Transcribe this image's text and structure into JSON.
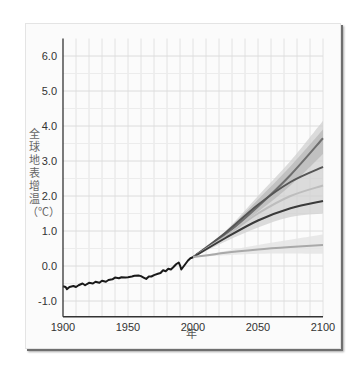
{
  "chart_data": {
    "type": "line",
    "title": "",
    "xlabel": "年",
    "ylabel": "全球地表增温（℃）",
    "xlim": [
      1900,
      2100
    ],
    "ylim": [
      -1.45,
      6.5
    ],
    "grid": true,
    "x_ticks": [
      "1900",
      "1950",
      "2000",
      "2050",
      "2100"
    ],
    "y_ticks": [
      "6.0",
      "5.0",
      "4.0",
      "3.0",
      "2.0",
      "1.0",
      "0.0",
      "-1.0"
    ],
    "x_tick_values": [
      1900,
      1950,
      2000,
      2050,
      2100
    ],
    "y_tick_values": [
      6,
      5,
      4,
      3,
      2,
      1,
      0,
      -1
    ],
    "historical": {
      "name": "observed",
      "color": "#1a1a1a",
      "points": [
        [
          1900,
          -0.58
        ],
        [
          1902,
          -0.6
        ],
        [
          1903,
          -0.66
        ],
        [
          1905,
          -0.6
        ],
        [
          1908,
          -0.57
        ],
        [
          1910,
          -0.6
        ],
        [
          1912,
          -0.55
        ],
        [
          1915,
          -0.5
        ],
        [
          1917,
          -0.55
        ],
        [
          1920,
          -0.48
        ],
        [
          1923,
          -0.5
        ],
        [
          1925,
          -0.45
        ],
        [
          1928,
          -0.48
        ],
        [
          1930,
          -0.42
        ],
        [
          1933,
          -0.45
        ],
        [
          1935,
          -0.4
        ],
        [
          1938,
          -0.38
        ],
        [
          1940,
          -0.33
        ],
        [
          1943,
          -0.35
        ],
        [
          1945,
          -0.32
        ],
        [
          1948,
          -0.33
        ],
        [
          1950,
          -0.32
        ],
        [
          1953,
          -0.3
        ],
        [
          1955,
          -0.28
        ],
        [
          1958,
          -0.27
        ],
        [
          1960,
          -0.29
        ],
        [
          1962,
          -0.33
        ],
        [
          1964,
          -0.37
        ],
        [
          1966,
          -0.3
        ],
        [
          1968,
          -0.3
        ],
        [
          1970,
          -0.26
        ],
        [
          1973,
          -0.22
        ],
        [
          1975,
          -0.2
        ],
        [
          1977,
          -0.12
        ],
        [
          1979,
          -0.15
        ],
        [
          1981,
          -0.08
        ],
        [
          1983,
          -0.1
        ],
        [
          1985,
          -0.03
        ],
        [
          1987,
          0.05
        ],
        [
          1989,
          0.1
        ],
        [
          1990,
          0.02
        ],
        [
          1991,
          -0.1
        ],
        [
          1992,
          -0.05
        ],
        [
          1994,
          0.05
        ],
        [
          1996,
          0.15
        ],
        [
          1998,
          0.22
        ],
        [
          2000,
          0.25
        ]
      ]
    },
    "series": [
      {
        "name": "scenario-high",
        "color": "#6e6e6e",
        "points": [
          [
            2000,
            0.25
          ],
          [
            2025,
            0.9
          ],
          [
            2050,
            1.7
          ],
          [
            2075,
            2.6
          ],
          [
            2100,
            3.65
          ]
        ]
      },
      {
        "name": "scenario-mid-high",
        "color": "#555555",
        "points": [
          [
            2000,
            0.25
          ],
          [
            2025,
            0.95
          ],
          [
            2050,
            1.75
          ],
          [
            2075,
            2.4
          ],
          [
            2100,
            2.83
          ]
        ]
      },
      {
        "name": "scenario-mid",
        "color": "#bdbdbd",
        "points": [
          [
            2000,
            0.25
          ],
          [
            2025,
            0.85
          ],
          [
            2050,
            1.5
          ],
          [
            2075,
            2.0
          ],
          [
            2100,
            2.3
          ]
        ]
      },
      {
        "name": "scenario-low",
        "color": "#3a3a3a",
        "points": [
          [
            2000,
            0.25
          ],
          [
            2025,
            0.8
          ],
          [
            2050,
            1.3
          ],
          [
            2075,
            1.65
          ],
          [
            2100,
            1.86
          ]
        ]
      },
      {
        "name": "constant-composition",
        "color": "#a9a9a9",
        "points": [
          [
            2000,
            0.25
          ],
          [
            2025,
            0.38
          ],
          [
            2050,
            0.47
          ],
          [
            2075,
            0.54
          ],
          [
            2100,
            0.6
          ]
        ]
      }
    ],
    "bands": [
      {
        "name": "outer-uncertainty",
        "color": "#d0d0d0",
        "upper": [
          [
            2000,
            0.25
          ],
          [
            2025,
            1.0
          ],
          [
            2050,
            2.0
          ],
          [
            2075,
            3.0
          ],
          [
            2100,
            4.15
          ]
        ],
        "lower": [
          [
            2000,
            0.25
          ],
          [
            2025,
            0.7
          ],
          [
            2050,
            1.1
          ],
          [
            2075,
            1.4
          ],
          [
            2100,
            1.5
          ]
        ]
      },
      {
        "name": "inner-uncertainty",
        "color": "#b8b8b8",
        "upper": [
          [
            2000,
            0.25
          ],
          [
            2025,
            0.98
          ],
          [
            2050,
            1.9
          ],
          [
            2075,
            2.85
          ],
          [
            2100,
            3.9
          ]
        ],
        "lower": [
          [
            2000,
            0.25
          ],
          [
            2025,
            0.88
          ],
          [
            2050,
            1.55
          ],
          [
            2075,
            2.3
          ],
          [
            2100,
            3.2
          ]
        ]
      }
    ],
    "constant_band": {
      "color": "#e3e3e3",
      "upper": [
        [
          2000,
          0.25
        ],
        [
          2050,
          0.6
        ],
        [
          2100,
          0.9
        ]
      ],
      "lower": [
        [
          2000,
          0.25
        ],
        [
          2050,
          0.35
        ],
        [
          2100,
          0.35
        ]
      ]
    }
  }
}
